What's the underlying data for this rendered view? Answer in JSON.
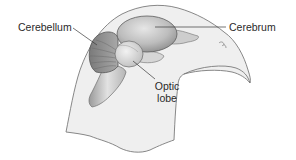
{
  "diagram": {
    "labels": {
      "cerebellum": "Cerebellum",
      "cerebrum": "Cerebrum",
      "optic_lobe_line1": "Optic",
      "optic_lobe_line2": "lobe"
    },
    "colors": {
      "head_fill": "#efefef",
      "head_stroke": "#6e6e6e",
      "cerebrum_fill": "#bdbdbd",
      "cerebellum_fill": "#8f8f8f",
      "optic_lobe_fill": "#dcdcdc",
      "brainstem_fill": "#cfcfcf",
      "leader_line": "#3a3a3a",
      "text": "#2a2a2a"
    }
  }
}
